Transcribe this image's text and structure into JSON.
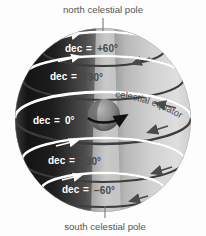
{
  "diagram": {
    "background_color": "#fdfdfd"
  },
  "labels": {
    "north_pole": "north celestial pole",
    "south_pole": "south celestial pole",
    "celestial_equator": "celestial equator"
  },
  "declination_rings": [
    {
      "id": "dec-plus-60",
      "prefix": "dec",
      "equals": "=",
      "value": "+60°",
      "declination": 60
    },
    {
      "id": "dec-plus-30",
      "prefix": "dec",
      "equals": "=",
      "value": "+30°",
      "declination": 30
    },
    {
      "id": "dec-zero",
      "prefix": "dec",
      "equals": "=",
      "value": "0°",
      "declination": 0
    },
    {
      "id": "dec-minus-30",
      "prefix": "dec",
      "equals": "=",
      "value": "−30°",
      "declination": -30
    },
    {
      "id": "dec-minus-60",
      "prefix": "dec",
      "equals": "=",
      "value": "−60°",
      "declination": -60
    }
  ],
  "colors": {
    "sphere_dark": "#1d1d1d",
    "sphere_mid": "#6f6f6f",
    "sphere_light": "#d8d8d8",
    "sphere_pale": "#e8e8e8",
    "ring_white": "#ffffff",
    "ring_dark": "#3c3c3c",
    "text_gray": "#555555",
    "earth_dark": "#4a4a4a",
    "earth_light": "#a8a8a8",
    "wedge": "#c9c9c9",
    "leader_line": "#777777"
  },
  "earth": {
    "name": "earth",
    "rotation_arrow": "rotation-direction"
  }
}
